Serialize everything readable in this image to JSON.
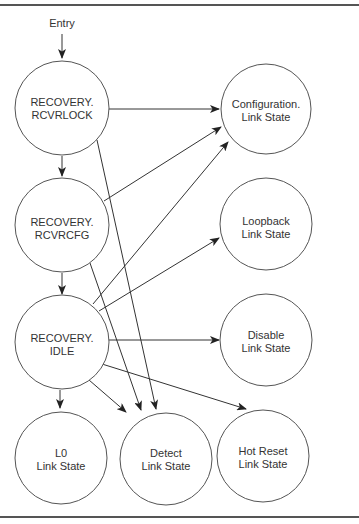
{
  "diagram": {
    "type": "state-transition",
    "entry_label": "Entry",
    "nodes": {
      "rcvrlock": {
        "line1": "RECOVERY.",
        "line2": "RCVRLOCK"
      },
      "rcvrcfg": {
        "line1": "RECOVERY.",
        "line2": "RCVRCFG"
      },
      "idle": {
        "line1": "RECOVERY.",
        "line2": "IDLE"
      },
      "configuration": {
        "line1": "Configuration.",
        "line2": "Link State"
      },
      "loopback": {
        "line1": "Loopback",
        "line2": "Link State"
      },
      "disable": {
        "line1": "Disable",
        "line2": "Link State"
      },
      "l0": {
        "line1": "L0",
        "line2": "Link State"
      },
      "detect": {
        "line1": "Detect",
        "line2": "Link State"
      },
      "hot_reset": {
        "line1": "Hot Reset",
        "line2": "Link State"
      }
    },
    "edges": [
      {
        "from": "entry",
        "to": "rcvrlock"
      },
      {
        "from": "rcvrlock",
        "to": "rcvrcfg"
      },
      {
        "from": "rcvrlock",
        "to": "configuration"
      },
      {
        "from": "rcvrlock",
        "to": "detect"
      },
      {
        "from": "rcvrcfg",
        "to": "idle"
      },
      {
        "from": "rcvrcfg",
        "to": "configuration"
      },
      {
        "from": "rcvrcfg",
        "to": "detect"
      },
      {
        "from": "idle",
        "to": "configuration"
      },
      {
        "from": "idle",
        "to": "loopback"
      },
      {
        "from": "idle",
        "to": "disable"
      },
      {
        "from": "idle",
        "to": "hot_reset"
      },
      {
        "from": "idle",
        "to": "detect"
      },
      {
        "from": "idle",
        "to": "l0"
      }
    ]
  }
}
